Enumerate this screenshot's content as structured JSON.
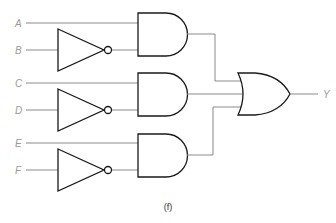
{
  "diagram": {
    "type": "logic-circuit",
    "caption": "(f)",
    "inputs": [
      {
        "label": "A",
        "y": 23,
        "inverted": false
      },
      {
        "label": "B",
        "y": 50,
        "inverted": true
      },
      {
        "label": "C",
        "y": 83,
        "inverted": false
      },
      {
        "label": "D",
        "y": 110,
        "inverted": true
      },
      {
        "label": "E",
        "y": 143,
        "inverted": false
      },
      {
        "label": "F",
        "y": 170,
        "inverted": true
      }
    ],
    "gates": [
      {
        "id": "not1",
        "type": "NOT",
        "input": "B"
      },
      {
        "id": "not2",
        "type": "NOT",
        "input": "D"
      },
      {
        "id": "not3",
        "type": "NOT",
        "input": "F"
      },
      {
        "id": "and1",
        "type": "AND",
        "inputs": [
          "A",
          "not1"
        ]
      },
      {
        "id": "and2",
        "type": "AND",
        "inputs": [
          "C",
          "not2"
        ]
      },
      {
        "id": "and3",
        "type": "AND",
        "inputs": [
          "E",
          "not3"
        ]
      },
      {
        "id": "or1",
        "type": "OR",
        "inputs": [
          "and1",
          "and2",
          "and3"
        ]
      }
    ],
    "output": {
      "label": "Y",
      "source": "or1"
    }
  }
}
